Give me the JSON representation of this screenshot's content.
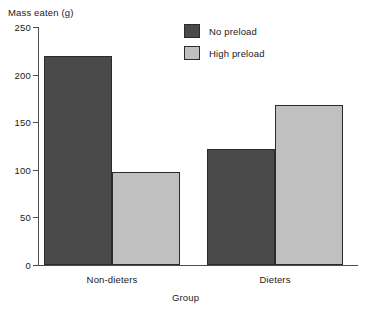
{
  "chart_data": {
    "type": "bar",
    "title": "",
    "subtitle": "",
    "xlabel": "Group",
    "ylabel": "Mass eaten (g)",
    "categories": [
      "Non-dieters",
      "Dieters"
    ],
    "series": [
      {
        "name": "No preload",
        "values": [
          220,
          122
        ],
        "color": "#4a4a4a"
      },
      {
        "name": "High preload",
        "values": [
          98,
          168
        ],
        "color": "#c0c0c0"
      }
    ],
    "ylim": [
      0,
      250
    ],
    "yticks": [
      0,
      50,
      100,
      150,
      200,
      250
    ],
    "ytick_labels": [
      "0",
      "50",
      "100",
      "150",
      "200",
      "250"
    ],
    "grid": false,
    "legend_position": "top-center",
    "legend_entries": [
      "No preload",
      "High preload"
    ],
    "annotations": []
  },
  "legend": {
    "items": [
      {
        "label": "No preload"
      },
      {
        "label": "High preload"
      }
    ]
  }
}
